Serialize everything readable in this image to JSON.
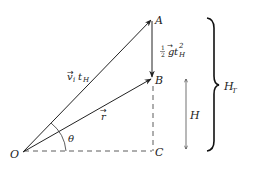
{
  "diagram": {
    "points": {
      "O": "O",
      "A": "A",
      "B": "B",
      "C": "C"
    },
    "vectors": {
      "vi_tH": {
        "base": "v",
        "sub1": "i",
        "mid": "t",
        "sub2": "H"
      },
      "r": {
        "base": "r"
      },
      "half_g_tH2": {
        "num": "1",
        "den": "2",
        "g": "g",
        "t": "t",
        "sup": "2",
        "sub": "H"
      }
    },
    "angle": "θ",
    "height": "H",
    "total_height": {
      "base": "H",
      "sub": "T"
    },
    "colors": {
      "stroke": "#222222",
      "background": "#ffffff"
    }
  }
}
